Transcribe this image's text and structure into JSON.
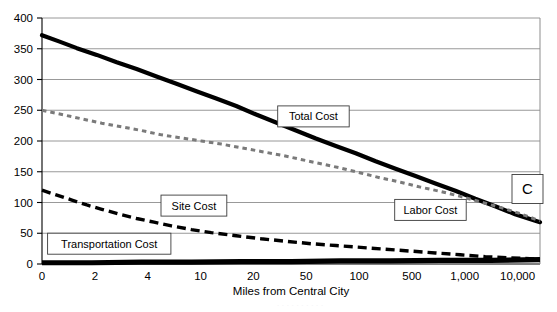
{
  "figure": {
    "panel_label": "C",
    "background_color": "#ffffff"
  },
  "chart_data": {
    "type": "line",
    "title": "",
    "subtitle": "",
    "xlabel": "Miles from Central City",
    "ylabel": "",
    "xscale": "log-like category",
    "x_tick_labels": [
      "0",
      "2",
      "4",
      "10",
      "20",
      "50",
      "100",
      "500",
      "1,000",
      "10,000"
    ],
    "x_tick_positions": [
      0,
      1,
      2,
      3,
      4,
      5,
      6,
      7,
      8,
      9
    ],
    "y_tick_labels": [
      "0",
      "50",
      "100",
      "150",
      "200",
      "250",
      "300",
      "350",
      "400"
    ],
    "ylim": [
      0,
      400
    ],
    "ytick_step": 50,
    "grid": true,
    "grid_axis": "y",
    "legend": "inline callout boxes",
    "annotations": [
      {
        "text": "Total Cost",
        "x_frac": 0.545,
        "y_value": 240
      },
      {
        "text": "Site Cost",
        "x_frac": 0.305,
        "y_value": 95
      },
      {
        "text": "Transportation Cost",
        "x_frac": 0.135,
        "y_value": 33
      },
      {
        "text": "Labor Cost",
        "x_frac": 0.78,
        "y_value": 88
      },
      {
        "text": "C",
        "x_frac": 0.975,
        "y_value": 122
      }
    ],
    "series": [
      {
        "name": "Total Cost",
        "style": "solid-thick-black",
        "color": "#000000",
        "points": [
          {
            "x_frac": 0.0,
            "y": 372
          },
          {
            "x_frac": 0.034,
            "y": 362
          },
          {
            "x_frac": 0.07,
            "y": 351
          },
          {
            "x_frac": 0.11,
            "y": 340
          },
          {
            "x_frac": 0.15,
            "y": 328
          },
          {
            "x_frac": 0.19,
            "y": 317
          },
          {
            "x_frac": 0.23,
            "y": 305
          },
          {
            "x_frac": 0.27,
            "y": 293
          },
          {
            "x_frac": 0.31,
            "y": 281
          },
          {
            "x_frac": 0.35,
            "y": 269
          },
          {
            "x_frac": 0.39,
            "y": 257
          },
          {
            "x_frac": 0.43,
            "y": 243
          },
          {
            "x_frac": 0.47,
            "y": 230
          },
          {
            "x_frac": 0.51,
            "y": 217
          },
          {
            "x_frac": 0.55,
            "y": 204
          },
          {
            "x_frac": 0.59,
            "y": 192
          },
          {
            "x_frac": 0.63,
            "y": 180
          },
          {
            "x_frac": 0.67,
            "y": 167
          },
          {
            "x_frac": 0.71,
            "y": 155
          },
          {
            "x_frac": 0.75,
            "y": 143
          },
          {
            "x_frac": 0.79,
            "y": 131
          },
          {
            "x_frac": 0.83,
            "y": 119
          },
          {
            "x_frac": 0.87,
            "y": 106
          },
          {
            "x_frac": 0.91,
            "y": 94
          },
          {
            "x_frac": 0.95,
            "y": 81
          },
          {
            "x_frac": 1.0,
            "y": 68
          }
        ]
      },
      {
        "name": "Labor Cost",
        "style": "dotted-gray",
        "color": "#7a7a7a",
        "points": [
          {
            "x_frac": 0.0,
            "y": 250
          },
          {
            "x_frac": 0.04,
            "y": 243
          },
          {
            "x_frac": 0.08,
            "y": 236
          },
          {
            "x_frac": 0.12,
            "y": 229
          },
          {
            "x_frac": 0.16,
            "y": 223
          },
          {
            "x_frac": 0.2,
            "y": 217
          },
          {
            "x_frac": 0.24,
            "y": 210
          },
          {
            "x_frac": 0.28,
            "y": 205
          },
          {
            "x_frac": 0.32,
            "y": 200
          },
          {
            "x_frac": 0.36,
            "y": 195
          },
          {
            "x_frac": 0.4,
            "y": 189
          },
          {
            "x_frac": 0.44,
            "y": 183
          },
          {
            "x_frac": 0.48,
            "y": 177
          },
          {
            "x_frac": 0.52,
            "y": 170
          },
          {
            "x_frac": 0.56,
            "y": 163
          },
          {
            "x_frac": 0.6,
            "y": 156
          },
          {
            "x_frac": 0.64,
            "y": 148
          },
          {
            "x_frac": 0.68,
            "y": 140
          },
          {
            "x_frac": 0.72,
            "y": 133
          },
          {
            "x_frac": 0.76,
            "y": 125
          },
          {
            "x_frac": 0.8,
            "y": 118
          },
          {
            "x_frac": 0.84,
            "y": 110
          },
          {
            "x_frac": 0.88,
            "y": 101
          },
          {
            "x_frac": 0.92,
            "y": 92
          },
          {
            "x_frac": 0.96,
            "y": 82
          },
          {
            "x_frac": 1.0,
            "y": 70
          }
        ]
      },
      {
        "name": "Site Cost",
        "style": "dashed-black",
        "color": "#000000",
        "points": [
          {
            "x_frac": 0.0,
            "y": 120
          },
          {
            "x_frac": 0.03,
            "y": 112
          },
          {
            "x_frac": 0.06,
            "y": 104
          },
          {
            "x_frac": 0.09,
            "y": 96
          },
          {
            "x_frac": 0.12,
            "y": 89
          },
          {
            "x_frac": 0.155,
            "y": 81
          },
          {
            "x_frac": 0.19,
            "y": 74
          },
          {
            "x_frac": 0.225,
            "y": 68
          },
          {
            "x_frac": 0.26,
            "y": 62
          },
          {
            "x_frac": 0.3,
            "y": 56
          },
          {
            "x_frac": 0.34,
            "y": 51
          },
          {
            "x_frac": 0.39,
            "y": 46
          },
          {
            "x_frac": 0.44,
            "y": 41
          },
          {
            "x_frac": 0.49,
            "y": 37
          },
          {
            "x_frac": 0.54,
            "y": 33
          },
          {
            "x_frac": 0.59,
            "y": 30
          },
          {
            "x_frac": 0.64,
            "y": 27
          },
          {
            "x_frac": 0.69,
            "y": 24
          },
          {
            "x_frac": 0.74,
            "y": 21
          },
          {
            "x_frac": 0.79,
            "y": 18
          },
          {
            "x_frac": 0.84,
            "y": 15
          },
          {
            "x_frac": 0.89,
            "y": 12
          },
          {
            "x_frac": 0.94,
            "y": 10
          },
          {
            "x_frac": 1.0,
            "y": 8
          }
        ]
      },
      {
        "name": "Transportation Cost",
        "style": "solid-thick-black-baseline",
        "color": "#000000",
        "points": [
          {
            "x_frac": 0.0,
            "y": 2
          },
          {
            "x_frac": 0.1,
            "y": 2
          },
          {
            "x_frac": 0.2,
            "y": 3
          },
          {
            "x_frac": 0.3,
            "y": 3
          },
          {
            "x_frac": 0.4,
            "y": 4
          },
          {
            "x_frac": 0.5,
            "y": 4
          },
          {
            "x_frac": 0.6,
            "y": 5
          },
          {
            "x_frac": 0.7,
            "y": 5
          },
          {
            "x_frac": 0.8,
            "y": 6
          },
          {
            "x_frac": 0.9,
            "y": 6
          },
          {
            "x_frac": 1.0,
            "y": 7
          }
        ]
      }
    ]
  }
}
